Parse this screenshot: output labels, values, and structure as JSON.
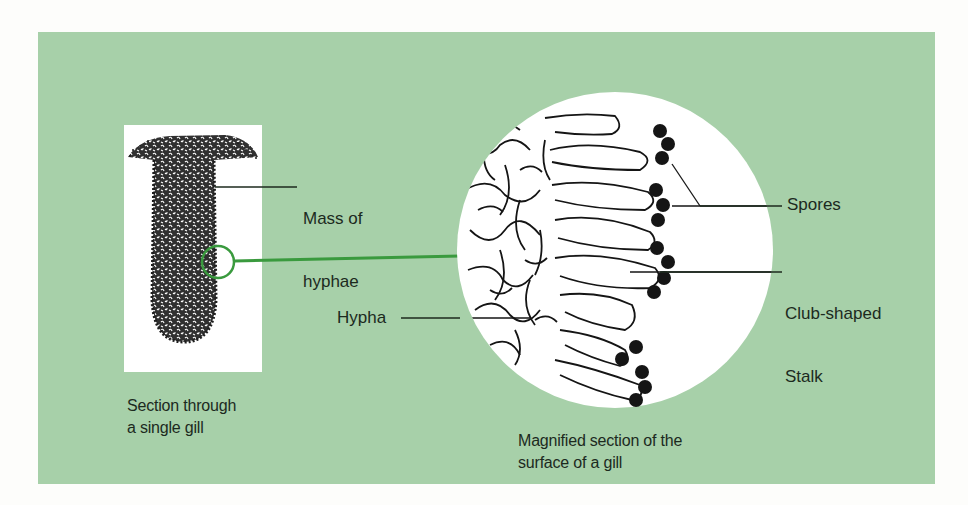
{
  "diagram": {
    "colors": {
      "panel_background": "#a7d0a9",
      "page_background": "#fdfdfb",
      "highlight_green": "#3a9a3e",
      "ink": "#1c2a1e"
    },
    "labels": {
      "mass_of_hyphae_line1": "Mass of",
      "mass_of_hyphae_line2": "hyphae",
      "spores": "Spores",
      "club_shaped_line1": "Club-shaped",
      "club_shaped_line2": "Stalk",
      "hypha": "Hypha"
    },
    "captions": {
      "gill_line1": "Section through",
      "gill_line2": "a single gill",
      "magnified_line1": "Magnified section of the",
      "magnified_line2": "surface of a gill"
    }
  }
}
